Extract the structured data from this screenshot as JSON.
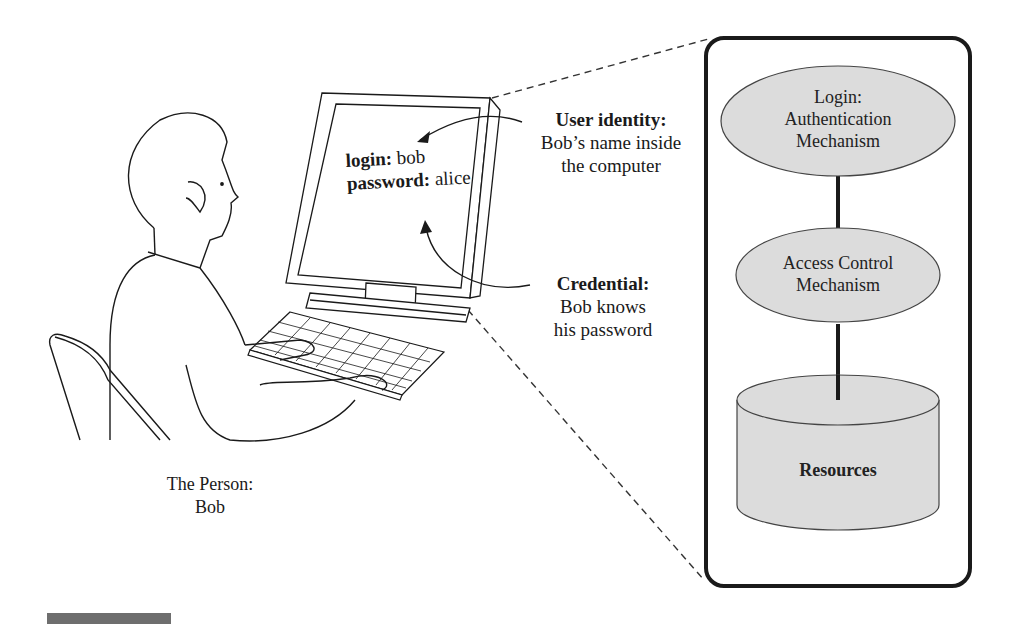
{
  "person": {
    "caption_line1": "The Person:",
    "caption_line2": "Bob"
  },
  "screen": {
    "login_label": "login:",
    "login_value": "bob",
    "password_label": "password:",
    "password_value": "alice"
  },
  "user_identity": {
    "title": "User identity:",
    "line1": "Bob’s name inside",
    "line2": "the computer"
  },
  "credential": {
    "title": "Credential:",
    "line1": "Bob knows",
    "line2": "his password"
  },
  "system_box": {
    "nodes": [
      {
        "shape": "ellipse",
        "lines": [
          "Login:",
          "Authentication",
          "Mechanism"
        ]
      },
      {
        "shape": "ellipse",
        "lines": [
          "Access Control",
          "Mechanism"
        ]
      },
      {
        "shape": "cylinder",
        "lines": [
          "Resources"
        ]
      }
    ]
  },
  "colors": {
    "node_fill": "#dcdcdc",
    "stroke": "#1a1a1a",
    "footer_bar": "#6e6e6e"
  }
}
